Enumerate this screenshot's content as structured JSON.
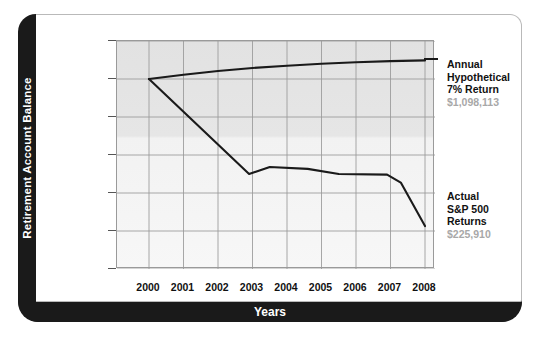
{
  "axes": {
    "y_title": "Retirement Account Balance",
    "x_title": "Years",
    "y_ticks": [
      "$1,200,000",
      "$1,000,000",
      "$800,000",
      "$600,000",
      "$400,000",
      "$200,000",
      "$0"
    ],
    "x_ticks": [
      "2000",
      "2001",
      "2002",
      "2003",
      "2004",
      "2005",
      "2006",
      "2007",
      "2008"
    ]
  },
  "legend": {
    "series1": {
      "line1": "Annual",
      "line2": "Hypothetical",
      "line3": "7% Return",
      "value": "$1,098,113"
    },
    "series2": {
      "line1": "Actual",
      "line2": "S&P 500",
      "line3": "Returns",
      "value": "$225,910"
    }
  },
  "colors": {
    "line": "#1a1a1a",
    "frame": "#1a1a1a",
    "plot_bg": "#e8e8e8",
    "grid": "#9a9a9a",
    "value_text": "#a8a8a8"
  },
  "chart_data": {
    "type": "line",
    "title": "",
    "xlabel": "Years",
    "ylabel": "Retirement Account Balance",
    "xlim": [
      2000,
      2008
    ],
    "ylim": [
      0,
      1200000
    ],
    "grid": true,
    "legend_position": "right",
    "x": [
      2000,
      2001,
      2002,
      2003,
      2004,
      2005,
      2006,
      2007,
      2008
    ],
    "series": [
      {
        "name": "Annual Hypothetical 7% Return",
        "end_label": "$1,098,113",
        "values": [
          1000000,
          1022000,
          1042000,
          1058000,
          1070000,
          1080000,
          1088000,
          1094000,
          1098113
        ]
      },
      {
        "name": "Actual S&P 500 Returns",
        "end_label": "$225,910",
        "values": [
          1000000,
          830000,
          640000,
          505000,
          540000,
          530000,
          500000,
          500000,
          225910
        ]
      }
    ],
    "series2_detail_points": [
      {
        "x": 2000.0,
        "y": 1000000
      },
      {
        "x": 2002.9,
        "y": 500000
      },
      {
        "x": 2003.5,
        "y": 537000
      },
      {
        "x": 2004.6,
        "y": 527000
      },
      {
        "x": 2005.5,
        "y": 500000
      },
      {
        "x": 2006.9,
        "y": 497000
      },
      {
        "x": 2007.3,
        "y": 455000
      },
      {
        "x": 2008.0,
        "y": 225910
      }
    ]
  }
}
